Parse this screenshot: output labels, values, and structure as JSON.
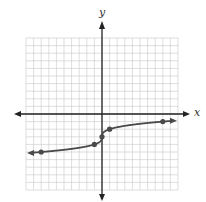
{
  "chart_data": {
    "type": "line",
    "title": "",
    "xlabel": "x",
    "ylabel": "y",
    "xlim": [
      -10,
      10
    ],
    "ylim": [
      -10,
      10
    ],
    "grid": true,
    "function": "y = cbrt(x) - 3",
    "key_points": [
      {
        "x": -8,
        "y": -5
      },
      {
        "x": -1,
        "y": -4
      },
      {
        "x": 0,
        "y": -3
      },
      {
        "x": 1,
        "y": -2
      },
      {
        "x": 8,
        "y": -1
      }
    ],
    "arrows_on_ends": true
  },
  "colors": {
    "grid": "#c8c8c8",
    "axis": "#222222",
    "curve": "#4a4a4a",
    "point": "#4a4a4a"
  }
}
